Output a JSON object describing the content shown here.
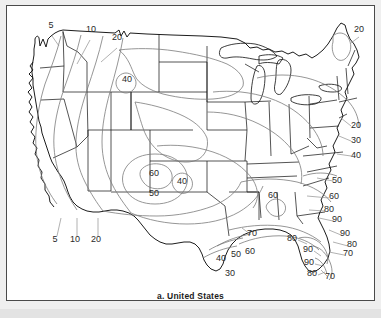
{
  "figure": {
    "caption": "a. United States",
    "type": "contour-map",
    "region": "United States",
    "frame_border_color": "#4a4a4a",
    "page_background": "#efefef",
    "map_background": "#ffffff",
    "boundary_color": "#1c1c1c",
    "contour_color": "#6f6f6f",
    "leader_color": "#8a8a8a"
  },
  "chart_data": {
    "type": "contour",
    "title": "a. United States",
    "xlabel": "",
    "ylabel": "",
    "grid": false,
    "legend": "none",
    "contour_levels": [
      5,
      10,
      20,
      30,
      40,
      50,
      60,
      70,
      80,
      90
    ],
    "value_range": [
      5,
      90
    ],
    "contour_interval": 10,
    "labels": [
      {
        "value": "5",
        "x": 44,
        "y": 22,
        "group": "northwest-leader"
      },
      {
        "value": "10",
        "x": 84,
        "y": 26,
        "group": "northwest-leader"
      },
      {
        "value": "20",
        "x": 110,
        "y": 34,
        "group": "northwest-leader"
      },
      {
        "value": "40",
        "x": 120,
        "y": 76,
        "group": "inland-closed-loop"
      },
      {
        "value": "20",
        "x": 352,
        "y": 26,
        "group": "northeast"
      },
      {
        "value": "20",
        "x": 349,
        "y": 122,
        "group": "east-coast"
      },
      {
        "value": "30",
        "x": 349,
        "y": 137,
        "group": "east-coast"
      },
      {
        "value": "40",
        "x": 349,
        "y": 152,
        "group": "east-coast"
      },
      {
        "value": "50",
        "x": 330,
        "y": 177,
        "group": "east-coast"
      },
      {
        "value": "60",
        "x": 147,
        "y": 170,
        "group": "southwest-closed-loop"
      },
      {
        "value": "50",
        "x": 147,
        "y": 190,
        "group": "southwest-closed-loop"
      },
      {
        "value": "40",
        "x": 175,
        "y": 178,
        "group": "southwest-closed-loop"
      },
      {
        "value": "5",
        "x": 48,
        "y": 236,
        "group": "southwest-leader"
      },
      {
        "value": "10",
        "x": 68,
        "y": 236,
        "group": "southwest-leader"
      },
      {
        "value": "20",
        "x": 89,
        "y": 236,
        "group": "southwest-leader"
      },
      {
        "value": "30",
        "x": 223,
        "y": 270,
        "group": "texas"
      },
      {
        "value": "40",
        "x": 214,
        "y": 255,
        "group": "texas"
      },
      {
        "value": "50",
        "x": 229,
        "y": 251,
        "group": "texas"
      },
      {
        "value": "60",
        "x": 243,
        "y": 248,
        "group": "texas"
      },
      {
        "value": "70",
        "x": 245,
        "y": 230,
        "group": "gulf"
      },
      {
        "value": "60",
        "x": 266,
        "y": 192,
        "group": "southeast-interior"
      },
      {
        "value": "60",
        "x": 327,
        "y": 193,
        "group": "southeast"
      },
      {
        "value": "80",
        "x": 322,
        "y": 206,
        "group": "southeast"
      },
      {
        "value": "90",
        "x": 330,
        "y": 216,
        "group": "southeast"
      },
      {
        "value": "90",
        "x": 338,
        "y": 230,
        "group": "florida"
      },
      {
        "value": "80",
        "x": 345,
        "y": 241,
        "group": "florida"
      },
      {
        "value": "70",
        "x": 341,
        "y": 250,
        "group": "florida"
      },
      {
        "value": "80",
        "x": 285,
        "y": 235,
        "group": "florida"
      },
      {
        "value": "90",
        "x": 301,
        "y": 246,
        "group": "florida"
      },
      {
        "value": "90",
        "x": 302,
        "y": 259,
        "group": "florida"
      },
      {
        "value": "80",
        "x": 305,
        "y": 270,
        "group": "florida"
      },
      {
        "value": "70",
        "x": 323,
        "y": 273,
        "group": "florida"
      }
    ]
  }
}
